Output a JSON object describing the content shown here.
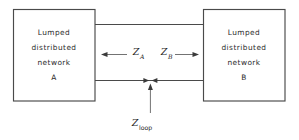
{
  "diagram": {
    "colors": {
      "line": "#4a4a4a",
      "text": "#2b2b2b",
      "background": "#ffffff",
      "arrow": "#3a3a3a"
    },
    "blocks": [
      {
        "id": "network-a",
        "lines": [
          "Lumped",
          "distributed",
          "network",
          "A"
        ]
      },
      {
        "id": "network-b",
        "lines": [
          "Lumped",
          "distributed",
          "network",
          "B"
        ]
      }
    ],
    "impedances": [
      {
        "id": "z-a",
        "symbol": "Z",
        "subscript": "A",
        "subscript_style": "italic",
        "arrow_direction": "left",
        "meaning": "impedance looking into network A"
      },
      {
        "id": "z-b",
        "symbol": "Z",
        "subscript": "B",
        "subscript_style": "italic",
        "arrow_direction": "right",
        "meaning": "impedance looking into network B"
      },
      {
        "id": "z-loop",
        "symbol": "Z",
        "subscript": "loop",
        "subscript_style": "upright",
        "arrow_direction": "up",
        "meaning": "total loop impedance at the reference plane"
      }
    ],
    "wires": [
      {
        "id": "upper-wire",
        "label": ""
      },
      {
        "id": "lower-wire",
        "label": ""
      }
    ]
  }
}
